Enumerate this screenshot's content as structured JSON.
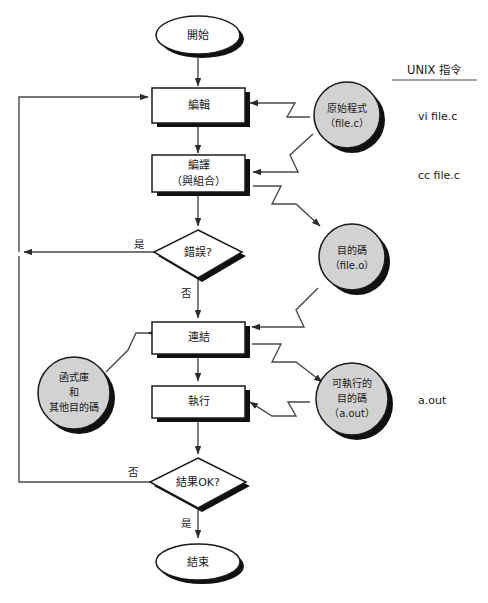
{
  "diagram": {
    "title_header": "UNIX 指令",
    "nodes": {
      "start": "開始",
      "edit": "編輯",
      "compile_line1": "編譯",
      "compile_line2": "（與組合）",
      "error_decision": "錯誤?",
      "link": "連結",
      "run": "執行",
      "result_decision": "結果OK?",
      "end": "結束",
      "source_line1": "原始程式",
      "source_line2": "（file.c）",
      "object_line1": "目的碼",
      "object_line2": "（file.o）",
      "library_line1": "函式庫",
      "library_line2": "和",
      "library_line3": "其他目的碼",
      "exec_line1": "可執行的",
      "exec_line2": "目的碼",
      "exec_line3": "（a.out）"
    },
    "edge_labels": {
      "error_yes": "是",
      "error_no": "否",
      "result_no": "否",
      "result_yes": "是"
    },
    "commands": [
      "vi file.c",
      "cc file.c",
      "a.out"
    ],
    "colors": {
      "circle_fill": "#d2d2d2",
      "box_fill": "#ffffff",
      "shadow": "#101010",
      "stroke": "#1a1a1a",
      "line": "#4a4a4a"
    }
  }
}
